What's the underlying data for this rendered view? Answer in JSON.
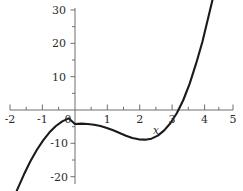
{
  "chart_data": {
    "type": "line",
    "title": "",
    "xlabel": "x",
    "ylabel": "",
    "xlim": [
      -2,
      5
    ],
    "ylim": [
      -23,
      31
    ],
    "grid": false,
    "legend": null,
    "x_ticks": [
      -2,
      -1,
      0,
      1,
      2,
      3,
      4,
      5
    ],
    "x_tick_labels": [
      "-2",
      "-1",
      "0",
      "1",
      "2",
      "3",
      "4",
      "5"
    ],
    "x_minor_step": 0.5,
    "y_ticks": [
      -20,
      -10,
      10,
      20,
      30
    ],
    "y_tick_labels": [
      "-20",
      "-10",
      "10",
      "20",
      "30"
    ],
    "y_minor_step": 5,
    "zero_label": "0",
    "curve_color": "#1a1a1a",
    "axis_color": "#6e6e6e",
    "function": "x^3 - 3.4x^2 + 1.3x - 4.2",
    "x_domain_drawn": [
      -2.0,
      4.62
    ],
    "features": {
      "local_max": [
        0.2,
        -4.1
      ],
      "local_min": [
        2.07,
        -9.0
      ],
      "root": [
        3.56,
        0
      ],
      "y_intercept": [
        0,
        -4.2
      ]
    },
    "x": [
      -2.0,
      -1.8,
      -1.6,
      -1.4,
      -1.2,
      -1.0,
      -0.8,
      -0.6,
      -0.4,
      -0.2,
      0.0,
      0.2,
      0.4,
      0.6,
      0.8,
      1.0,
      1.2,
      1.4,
      1.6,
      1.8,
      2.0,
      2.2,
      2.4,
      2.6,
      2.8,
      3.0,
      3.2,
      3.4,
      3.6,
      3.8,
      4.0,
      4.2,
      4.4,
      4.62
    ],
    "y": [
      -28.4,
      -23.6,
      -19.3,
      -15.4,
      -12.0,
      -9.1,
      -6.7,
      -4.8,
      -3.4,
      -2.5,
      -4.2,
      -4.1,
      -4.2,
      -4.4,
      -4.8,
      -5.4,
      -6.1,
      -6.9,
      -7.7,
      -8.4,
      -8.8,
      -8.9,
      -8.6,
      -7.7,
      -6.1,
      -3.9,
      -0.9,
      3.0,
      7.9,
      13.9,
      20.5,
      28.4,
      36.4,
      47.0
    ]
  },
  "labels": {
    "y_top": "30",
    "y_20": "20",
    "y_10": "10",
    "y_neg10": "-10",
    "y_neg20": "-20",
    "x_neg2": "-2",
    "x_neg1": "-1",
    "x_zero": "0",
    "x_1": "1",
    "x_2": "2",
    "x_3": "3",
    "x_4": "4",
    "x_5": "5",
    "x_axis_name": "x"
  }
}
